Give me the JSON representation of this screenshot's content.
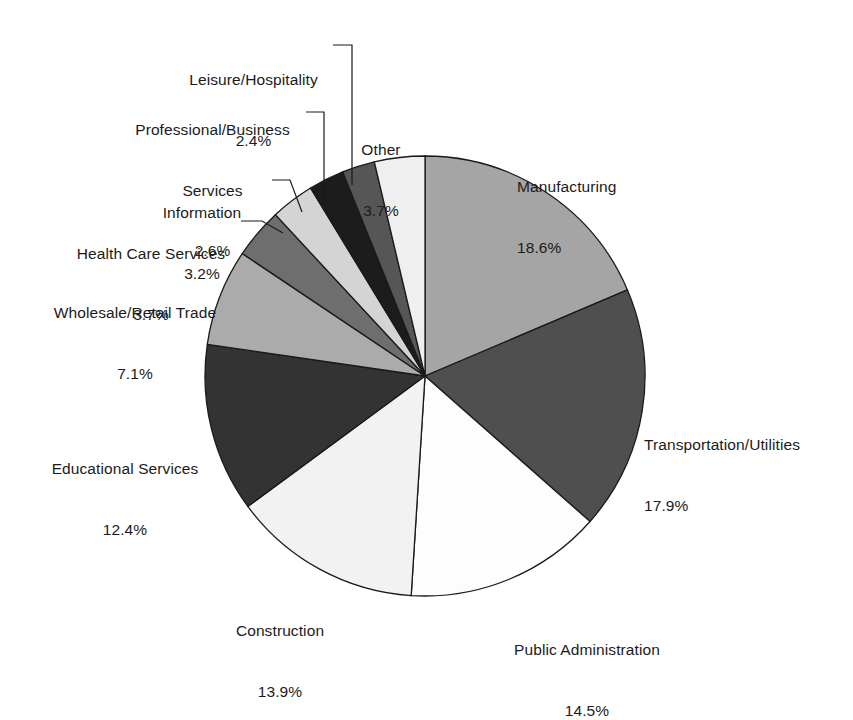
{
  "chart_data": {
    "type": "pie",
    "title": "",
    "subtitle": "",
    "xlabel": "",
    "ylabel": "",
    "legend_position": "none",
    "grid": false,
    "value_unit": "%",
    "start_angle_deg": 0,
    "direction": "clockwise",
    "categories": [
      "Manufacturing",
      "Transportation/Utilities",
      "Public Administration",
      "Construction",
      "Educational Services",
      "Wholesale/Retail Trade",
      "Health Care Services",
      "Information",
      "Professional/Business Services",
      "Leisure/Hospitality",
      "Other"
    ],
    "values": [
      18.6,
      17.9,
      14.5,
      13.9,
      12.4,
      7.1,
      3.7,
      3.2,
      2.6,
      2.4,
      3.7
    ],
    "colors": [
      "#a5a5a5",
      "#4f4f4f",
      "#fdfdfd",
      "#f2f2f2",
      "#333333",
      "#ababab",
      "#6e6e6e",
      "#d4d4d4",
      "#1c1c1c",
      "#565656",
      "#efefef"
    ],
    "slices": [
      {
        "label": "Manufacturing",
        "value": 18.6,
        "value_text": "18.6%",
        "color": "#a5a5a5"
      },
      {
        "label": "Transportation/Utilities",
        "value": 17.9,
        "value_text": "17.9%",
        "color": "#4f4f4f"
      },
      {
        "label": "Public Administration",
        "value": 14.5,
        "value_text": "14.5%",
        "color": "#fdfdfd"
      },
      {
        "label": "Construction",
        "value": 13.9,
        "value_text": "13.9%",
        "color": "#f2f2f2"
      },
      {
        "label": "Educational Services",
        "value": 12.4,
        "value_text": "12.4%",
        "color": "#333333"
      },
      {
        "label": "Wholesale/Retail Trade",
        "value": 7.1,
        "value_text": "7.1%",
        "color": "#ababab"
      },
      {
        "label": "Health Care Services",
        "value": 3.7,
        "value_text": "3.7%",
        "color": "#6e6e6e"
      },
      {
        "label": "Information",
        "value": 3.2,
        "value_text": "3.2%",
        "color": "#d4d4d4"
      },
      {
        "label": "Professional/Business Services",
        "value": 2.6,
        "value_text": "2.6%",
        "color": "#1c1c1c"
      },
      {
        "label": "Leisure/Hospitality",
        "value": 2.4,
        "value_text": "2.4%",
        "color": "#565656"
      },
      {
        "label": "Other",
        "value": 3.7,
        "value_text": "3.7%",
        "color": "#efefef"
      }
    ]
  },
  "labels": {
    "manufacturing": {
      "name": "Manufacturing",
      "pct": "18.6%"
    },
    "transportation": {
      "name": "Transportation/Utilities",
      "pct": "17.9%"
    },
    "public_admin": {
      "name": "Public Administration",
      "pct": "14.5%"
    },
    "construction": {
      "name": "Construction",
      "pct": "13.9%"
    },
    "education": {
      "name": "Educational Services",
      "pct": "12.4%"
    },
    "wholesale": {
      "name": "Wholesale/Retail Trade",
      "pct": "7.1%"
    },
    "healthcare": {
      "name": "Health Care Services",
      "pct": "3.7%"
    },
    "information": {
      "name": "Information",
      "pct": "3.2%"
    },
    "professional": {
      "name": "Professional/Business",
      "name2": "Services",
      "pct": "2.6%"
    },
    "leisure": {
      "name": "Leisure/Hospitality",
      "pct": "2.4%"
    },
    "other": {
      "name": "Other",
      "pct": "3.7%"
    }
  }
}
